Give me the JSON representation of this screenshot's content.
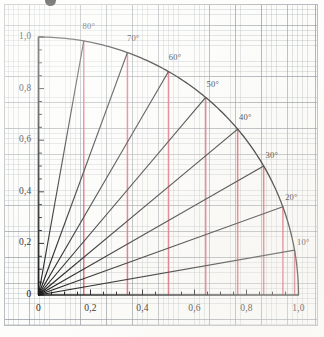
{
  "figure": {
    "kind": "unit-quarter-circle-trigonometry-diagram",
    "top_mark": "•",
    "decimal_separator": ","
  },
  "axes": {
    "x": {
      "tick_labels": [
        "0",
        "0,2",
        "0,4",
        "0,6",
        "0,8",
        "1,0"
      ],
      "tick_values": [
        0,
        0.2,
        0.4,
        0.6,
        0.8,
        1.0
      ],
      "range": [
        0,
        1.0
      ],
      "minor_tick_step": 0.05
    },
    "y": {
      "tick_labels": [
        "0",
        "0,2",
        "0,4",
        "0,6",
        "0,8",
        "1,0"
      ],
      "tick_values": [
        0,
        0.2,
        0.4,
        0.6,
        0.8,
        1.0
      ],
      "range": [
        0,
        1.0
      ],
      "minor_tick_step": 0.05
    }
  },
  "colors": {
    "ink": "#141414",
    "projection": "#d94f63",
    "grid_major": "#787e86",
    "grid_minor": "#969ca4",
    "paper": "#fcfcfa",
    "border": "#b9bcc0"
  },
  "chart_data": {
    "type": "line",
    "title": "",
    "subtitle": "",
    "xlabel": "",
    "ylabel": "",
    "xlim": [
      0,
      1.0
    ],
    "ylim": [
      0,
      1.0
    ],
    "grid": true,
    "legend": null,
    "arc": {
      "name": "unit circle quarter arc",
      "radius": 1.0,
      "from_deg": 0,
      "to_deg": 90
    },
    "series": [
      {
        "name": "radial angle lines",
        "description": "straight rays from origin to the unit arc",
        "points": [
          {
            "label": "10°",
            "angle_deg": 10,
            "x": 0.985,
            "y": 0.174
          },
          {
            "label": "20°",
            "angle_deg": 20,
            "x": 0.94,
            "y": 0.342
          },
          {
            "label": "30°",
            "angle_deg": 30,
            "x": 0.866,
            "y": 0.5
          },
          {
            "label": "40°",
            "angle_deg": 40,
            "x": 0.766,
            "y": 0.643
          },
          {
            "label": "50°",
            "angle_deg": 50,
            "x": 0.643,
            "y": 0.766
          },
          {
            "label": "60°",
            "angle_deg": 60,
            "x": 0.5,
            "y": 0.866
          },
          {
            "label": "70°",
            "angle_deg": 70,
            "x": 0.342,
            "y": 0.94
          },
          {
            "label": "80°",
            "angle_deg": 80,
            "x": 0.174,
            "y": 0.985
          }
        ]
      },
      {
        "name": "vertical projection lines",
        "description": "red verticals dropped from each arc point to the x-axis (cosine)",
        "x_values": [
          0.174,
          0.342,
          0.5,
          0.643,
          0.766,
          0.866,
          0.94,
          0.985
        ],
        "y_tops": [
          0.985,
          0.94,
          0.866,
          0.766,
          0.643,
          0.5,
          0.342,
          0.174
        ]
      }
    ],
    "annotations": [
      {
        "text": "80°",
        "x": 0.174,
        "y": 0.985
      },
      {
        "text": "70°",
        "x": 0.342,
        "y": 0.94
      },
      {
        "text": "60°",
        "x": 0.5,
        "y": 0.866
      },
      {
        "text": "50°",
        "x": 0.643,
        "y": 0.766
      },
      {
        "text": "40°",
        "x": 0.766,
        "y": 0.643
      },
      {
        "text": "30°",
        "x": 0.866,
        "y": 0.5
      },
      {
        "text": "20°",
        "x": 0.94,
        "y": 0.342
      },
      {
        "text": "10°",
        "x": 0.985,
        "y": 0.174
      }
    ]
  }
}
